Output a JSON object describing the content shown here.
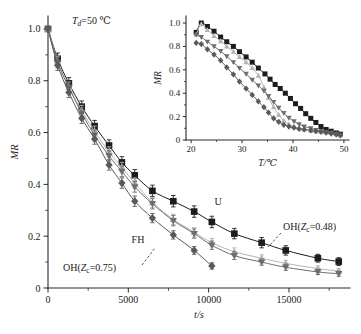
{
  "figure": {
    "annotation_td": "T",
    "annotation_td_sub": "d",
    "annotation_td_rest": "=50 ℃",
    "label_u": "U",
    "label_fh": "FH",
    "label_oh048_pre": "OH(",
    "label_oh048_z": "Z",
    "label_oh048_sub": "c",
    "label_oh048_post": "=0.48)",
    "label_oh075_pre": "OH(",
    "label_oh075_z": "Z",
    "label_oh075_sub": "c",
    "label_oh075_post": "=0.75)"
  },
  "chart_data": {
    "type": "line",
    "title": "",
    "xlabel": "t/s",
    "ylabel": "MR",
    "xlim": [
      0,
      18800
    ],
    "ylim": [
      0,
      1.05
    ],
    "xticks": [
      0,
      5000,
      10000,
      15000
    ],
    "xticklabels": [
      "0",
      "5000",
      "10000",
      "15000"
    ],
    "yticks": [
      0,
      0.2,
      0.4,
      0.6,
      0.8,
      1.0
    ],
    "yticklabels": [
      "0",
      "0.2",
      "0.4",
      "0.6",
      "0.8",
      "1.0"
    ],
    "grid": false,
    "legend": "annotations-on-curves",
    "annotations": [
      {
        "text": "T_d=50 ℃",
        "x": 1500,
        "y": 0.98
      },
      {
        "text": "U",
        "x": 11800,
        "y": 0.3
      },
      {
        "text": "FH",
        "x": 7100,
        "y": 0.2
      },
      {
        "text": "OH(Z_c=0.48)",
        "x": 16900,
        "y": 0.195
      },
      {
        "text": "OH(Z_c=0.75)",
        "x": 4200,
        "y": 0.075
      }
    ],
    "series": [
      {
        "name": "U",
        "marker": "square",
        "color": "#1c1c1c",
        "x": [
          0,
          600,
          1300,
          2100,
          2900,
          3800,
          4600,
          5400,
          6500,
          7800,
          9100,
          10200,
          11600,
          13300,
          14800,
          16800,
          18100
        ],
        "y": [
          1.0,
          0.885,
          0.79,
          0.7,
          0.625,
          0.55,
          0.485,
          0.435,
          0.375,
          0.335,
          0.295,
          0.255,
          0.21,
          0.175,
          0.145,
          0.115,
          0.102
        ],
        "yerr": [
          0.0,
          0.022,
          0.022,
          0.022,
          0.022,
          0.022,
          0.022,
          0.022,
          0.022,
          0.022,
          0.022,
          0.022,
          0.02,
          0.02,
          0.018,
          0.015,
          0.015
        ]
      },
      {
        "name": "OH(Zc=0.48)",
        "marker": "triangle-up",
        "color": "#b4b4b4",
        "x": [
          0,
          600,
          1300,
          2100,
          2900,
          3800,
          4600,
          5400,
          6500,
          7800,
          9100,
          10200,
          11600,
          13300,
          14800,
          16800,
          18100
        ],
        "y": [
          1.0,
          0.875,
          0.775,
          0.685,
          0.605,
          0.525,
          0.465,
          0.405,
          0.33,
          0.265,
          0.215,
          0.175,
          0.14,
          0.115,
          0.095,
          0.075,
          0.065
        ],
        "yerr": [
          0.0,
          0.02,
          0.02,
          0.02,
          0.02,
          0.02,
          0.02,
          0.02,
          0.02,
          0.02,
          0.018,
          0.016,
          0.015,
          0.013,
          0.012,
          0.01,
          0.01
        ]
      },
      {
        "name": "FH",
        "marker": "triangle-down",
        "color": "#6e6e6e",
        "x": [
          0,
          600,
          1300,
          2100,
          2900,
          3800,
          4600,
          5400,
          6500,
          7800,
          9100,
          10200,
          11600,
          13300,
          14800,
          16800,
          18100
        ],
        "y": [
          1.0,
          0.87,
          0.775,
          0.675,
          0.59,
          0.51,
          0.45,
          0.39,
          0.325,
          0.26,
          0.21,
          0.165,
          0.125,
          0.1,
          0.08,
          0.062,
          0.055
        ],
        "yerr": [
          0.0,
          0.02,
          0.02,
          0.02,
          0.02,
          0.02,
          0.02,
          0.02,
          0.02,
          0.02,
          0.018,
          0.016,
          0.015,
          0.012,
          0.012,
          0.01,
          0.01
        ]
      },
      {
        "name": "OH(Zc=0.75)",
        "marker": "diamond",
        "color": "#5a5a5a",
        "x": [
          0,
          600,
          1300,
          2100,
          2900,
          3800,
          4600,
          5400,
          6500,
          7800,
          9100,
          10200
        ],
        "y": [
          1.0,
          0.86,
          0.755,
          0.655,
          0.575,
          0.475,
          0.405,
          0.335,
          0.27,
          0.205,
          0.145,
          0.085
        ],
        "yerr": [
          0.0,
          0.02,
          0.02,
          0.02,
          0.02,
          0.02,
          0.02,
          0.02,
          0.018,
          0.016,
          0.015,
          0.012
        ]
      }
    ]
  },
  "inset_chart_data": {
    "type": "line",
    "title": "",
    "xlabel": "T/℃",
    "ylabel": "MR",
    "xlim": [
      19,
      51
    ],
    "ylim": [
      0,
      1.06
    ],
    "xticks": [
      20,
      30,
      40,
      50
    ],
    "xticklabels": [
      "20",
      "30",
      "40",
      "50"
    ],
    "yticks": [
      0,
      0.2,
      0.4,
      0.6,
      0.8,
      1.0
    ],
    "yticklabels": [
      "0",
      "0.2",
      "0.4",
      "0.6",
      "0.8",
      "1.0"
    ],
    "grid": false,
    "series": [
      {
        "name": "U",
        "marker": "square",
        "color": "#1c1c1c",
        "x": [
          21.0,
          22.0,
          23.2,
          24.5,
          25.8,
          27.0,
          28.3,
          29.5,
          30.8,
          32.0,
          33.2,
          34.5,
          35.5,
          36.5,
          37.5,
          38.5,
          39.5,
          40.5,
          41.5,
          42.5,
          43.5,
          44.5,
          45.5,
          46.5,
          47.5,
          48.5,
          49.3
        ],
        "y": [
          0.92,
          1.0,
          0.97,
          0.93,
          0.88,
          0.84,
          0.8,
          0.755,
          0.71,
          0.665,
          0.615,
          0.565,
          0.52,
          0.475,
          0.44,
          0.4,
          0.355,
          0.31,
          0.27,
          0.225,
          0.185,
          0.15,
          0.115,
          0.09,
          0.075,
          0.06,
          0.05
        ]
      },
      {
        "name": "OH(Zc=0.48)",
        "marker": "triangle-up",
        "color": "#b4b4b4",
        "x": [
          21.0,
          22.0,
          23.2,
          24.5,
          25.8,
          27.0,
          28.3,
          29.5,
          30.8,
          32.0,
          33.2,
          34.3,
          35.2,
          36.2,
          37.2,
          38.2,
          39.2,
          40.2,
          41.2,
          42.2,
          43.5,
          44.5,
          45.5,
          46.5,
          47.5,
          48.5,
          49.3
        ],
        "y": [
          0.9,
          0.99,
          0.94,
          0.89,
          0.845,
          0.8,
          0.755,
          0.71,
          0.665,
          0.615,
          0.55,
          0.45,
          0.36,
          0.28,
          0.215,
          0.165,
          0.135,
          0.115,
          0.1,
          0.09,
          0.08,
          0.075,
          0.07,
          0.065,
          0.06,
          0.05,
          0.04
        ]
      },
      {
        "name": "FH",
        "marker": "triangle-down",
        "color": "#6e6e6e",
        "x": [
          21.0,
          22.0,
          23.2,
          24.5,
          25.8,
          27.0,
          28.3,
          29.5,
          30.8,
          32.0,
          33.2,
          34.3,
          35.2,
          36.2,
          37.2,
          38.2,
          39.2,
          40.2,
          41.2,
          42.2,
          43.5,
          44.5,
          45.5,
          46.5,
          47.5,
          48.5,
          49.3
        ],
        "y": [
          0.9,
          0.88,
          0.84,
          0.8,
          0.76,
          0.715,
          0.665,
          0.615,
          0.565,
          0.515,
          0.465,
          0.42,
          0.375,
          0.325,
          0.275,
          0.23,
          0.19,
          0.16,
          0.135,
          0.115,
          0.1,
          0.085,
          0.075,
          0.065,
          0.06,
          0.05,
          0.04
        ]
      },
      {
        "name": "OH(Zc=0.75)",
        "marker": "diamond",
        "color": "#5a5a5a",
        "x": [
          21.0,
          22.0,
          23.2,
          24.5,
          25.8,
          27.0,
          28.3,
          29.5,
          30.8,
          32.0,
          33.2,
          34.3,
          35.2,
          36.2,
          37.2,
          38.2,
          39.2,
          40.2,
          41.2,
          42.2,
          43.5,
          44.5,
          45.5,
          46.5,
          47.5,
          48.5,
          49.3
        ],
        "y": [
          0.83,
          0.82,
          0.775,
          0.73,
          0.68,
          0.62,
          0.56,
          0.5,
          0.44,
          0.385,
          0.33,
          0.28,
          0.235,
          0.185,
          0.155,
          0.13,
          0.115,
          0.105,
          0.095,
          0.09,
          0.082,
          0.075,
          0.07,
          0.062,
          0.055,
          0.048,
          0.04
        ]
      }
    ]
  }
}
